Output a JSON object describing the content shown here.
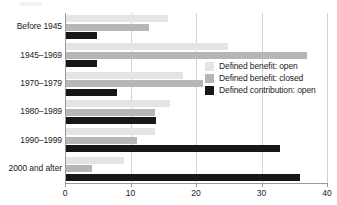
{
  "chart_data": {
    "type": "bar",
    "orientation": "horizontal",
    "title": "",
    "xlabel": "",
    "ylabel": "",
    "xlim": [
      0,
      40
    ],
    "xticks": [
      0,
      10,
      20,
      30,
      40
    ],
    "xtick_labels": [
      "0",
      "10",
      "20",
      "30",
      "40"
    ],
    "grid": "vertical",
    "legend_position": "middle-right",
    "categories": [
      "Before 1945",
      "1945–1969",
      "1970–1979",
      "1980–1989",
      "1990–1999",
      "2000 and after"
    ],
    "series": [
      {
        "name": "Defined benefit: open",
        "color": "#e4e4e4",
        "values": [
          15.7,
          24.9,
          18.0,
          16.0,
          13.7,
          9.0
        ]
      },
      {
        "name": "Defined benefit: closed",
        "color": "#b6b6b6",
        "values": [
          12.8,
          37.0,
          21.0,
          13.8,
          11.0,
          4.1
        ]
      },
      {
        "name": "Defined contribution: open",
        "color": "#171717",
        "values": [
          4.9,
          4.9,
          8.0,
          13.9,
          32.8,
          35.9
        ]
      }
    ]
  },
  "legend": {
    "items": [
      {
        "label": "Defined benefit: open",
        "color": "#e4e4e4"
      },
      {
        "label": "Defined benefit: closed",
        "color": "#b6b6b6"
      },
      {
        "label": "Defined contribution: open",
        "color": "#171717"
      }
    ]
  },
  "axis": {
    "y_color": "#9a9a9a",
    "x_color": "#9a9a9a",
    "grid_color": "#d2d2d2"
  }
}
